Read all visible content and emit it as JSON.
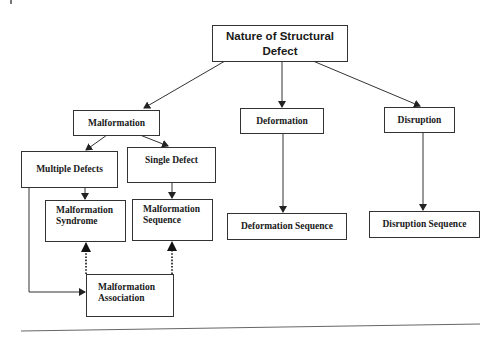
{
  "diagram": {
    "title": "Nature of Structural Defect",
    "nodes": {
      "root": "Nature of Structural Defect",
      "malformation": "Malformation",
      "deformation": "Deformation",
      "disruption": "Disruption",
      "multiple_defects": "Multiple Defects",
      "single_defect": "Single Defect",
      "malformation_syndrome_line1": "Malformation",
      "malformation_syndrome_line2": "Syndrome",
      "malformation_sequence_line1": "Malformation",
      "malformation_sequence_line2": "Sequence",
      "deformation_sequence": "Deformation Sequence",
      "disruption_sequence": "Disruption Sequence",
      "malformation_association_line1": "Malformation",
      "malformation_association_line2": "Association"
    },
    "edges": [
      {
        "from": "Nature of Structural Defect",
        "to": "Malformation",
        "style": "solid"
      },
      {
        "from": "Nature of Structural Defect",
        "to": "Deformation",
        "style": "solid"
      },
      {
        "from": "Nature of Structural Defect",
        "to": "Disruption",
        "style": "solid"
      },
      {
        "from": "Malformation",
        "to": "Multiple Defects",
        "style": "solid"
      },
      {
        "from": "Malformation",
        "to": "Single Defect",
        "style": "solid"
      },
      {
        "from": "Multiple Defects",
        "to": "Malformation Syndrome",
        "style": "solid"
      },
      {
        "from": "Multiple Defects",
        "to": "Malformation Association",
        "style": "solid"
      },
      {
        "from": "Single Defect",
        "to": "Malformation Sequence",
        "style": "solid"
      },
      {
        "from": "Deformation",
        "to": "Deformation Sequence",
        "style": "solid"
      },
      {
        "from": "Disruption",
        "to": "Disruption Sequence",
        "style": "solid"
      },
      {
        "from": "Malformation Association",
        "to": "Malformation Syndrome",
        "style": "dotted"
      },
      {
        "from": "Malformation Association",
        "to": "Malformation Sequence",
        "style": "dotted"
      }
    ],
    "colors": {
      "line": "#333333",
      "text": "#1a1a1a",
      "background": "#ffffff"
    }
  }
}
